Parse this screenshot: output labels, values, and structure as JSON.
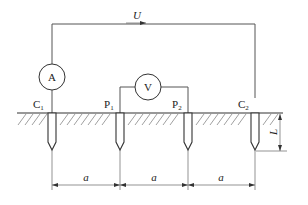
{
  "diagram": {
    "source_label": "U",
    "ammeter_label": "A",
    "voltmeter_label": "V",
    "electrodes": [
      {
        "id": "C1",
        "main": "C",
        "sub": "1"
      },
      {
        "id": "P1",
        "main": "P",
        "sub": "1"
      },
      {
        "id": "P2",
        "main": "P",
        "sub": "2"
      },
      {
        "id": "C2",
        "main": "C",
        "sub": "2"
      }
    ],
    "spacing_labels": [
      "a",
      "a",
      "a"
    ],
    "depth_label": "L",
    "colors": {
      "line": "#555555",
      "electrode": "#333333",
      "hatch": "#777777",
      "background": "#ffffff"
    }
  }
}
